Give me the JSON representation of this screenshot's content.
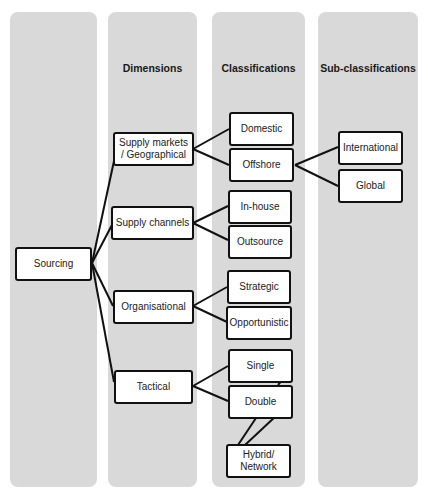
{
  "columns": [
    {
      "id": "root",
      "heading": ""
    },
    {
      "id": "dimensions",
      "heading": "Dimensions"
    },
    {
      "id": "classifications",
      "heading": "Classifications"
    },
    {
      "id": "subclassifications",
      "heading": "Sub-classifications"
    }
  ],
  "nodes": {
    "sourcing": "Sourcing",
    "supply_markets": "Supply markets / Geographical",
    "supply_channels": "Supply channels",
    "organisational": "Organisational",
    "tactical": "Tactical",
    "domestic": "Domestic",
    "offshore": "Offshore",
    "in_house": "In-house",
    "outsource": "Outsource",
    "strategic": "Strategic",
    "opportunistic": "Opportunistic",
    "single": "Single",
    "double": "Double",
    "hybrid_network": "Hybrid/ Network",
    "international": "International",
    "global": "Global"
  },
  "edges": [
    [
      "sourcing",
      "supply_markets"
    ],
    [
      "sourcing",
      "supply_channels"
    ],
    [
      "sourcing",
      "organisational"
    ],
    [
      "sourcing",
      "tactical"
    ],
    [
      "supply_markets",
      "domestic"
    ],
    [
      "supply_markets",
      "offshore"
    ],
    [
      "supply_channels",
      "in_house"
    ],
    [
      "supply_channels",
      "outsource"
    ],
    [
      "organisational",
      "strategic"
    ],
    [
      "organisational",
      "opportunistic"
    ],
    [
      "tactical",
      "single"
    ],
    [
      "tactical",
      "double"
    ],
    [
      "offshore",
      "international"
    ],
    [
      "offshore",
      "global"
    ],
    [
      "single",
      "hybrid_network"
    ],
    [
      "double",
      "hybrid_network"
    ]
  ]
}
